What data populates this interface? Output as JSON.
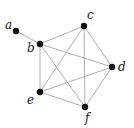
{
  "graph": {
    "nodes": [
      {
        "id": "a",
        "label": "a",
        "x": 16,
        "y": 31,
        "lx": 5,
        "ly": 29
      },
      {
        "id": "b",
        "label": "b",
        "x": 40,
        "y": 44,
        "lx": 27,
        "ly": 52
      },
      {
        "id": "c",
        "label": "c",
        "x": 84,
        "y": 26,
        "lx": 87,
        "ly": 19
      },
      {
        "id": "d",
        "label": "d",
        "x": 112,
        "y": 67,
        "lx": 118,
        "ly": 71
      },
      {
        "id": "e",
        "label": "e",
        "x": 40,
        "y": 92,
        "lx": 27,
        "ly": 104
      },
      {
        "id": "f",
        "label": "f",
        "x": 85,
        "y": 107,
        "lx": 85,
        "ly": 122
      }
    ],
    "edges": [
      [
        "a",
        "b"
      ],
      [
        "b",
        "c"
      ],
      [
        "b",
        "d"
      ],
      [
        "b",
        "e"
      ],
      [
        "b",
        "f"
      ],
      [
        "c",
        "d"
      ],
      [
        "c",
        "e"
      ],
      [
        "c",
        "f"
      ],
      [
        "d",
        "e"
      ],
      [
        "d",
        "f"
      ],
      [
        "e",
        "f"
      ]
    ],
    "colors": {
      "edge": "#9a9a9a",
      "node": "#111111"
    }
  }
}
